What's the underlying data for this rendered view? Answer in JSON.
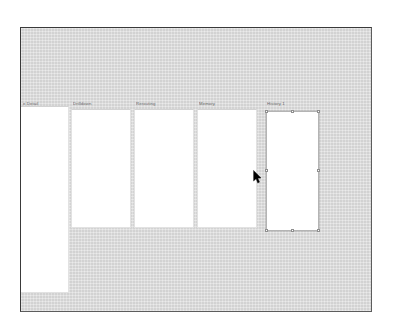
{
  "canvas": {
    "width": 393,
    "height": 333,
    "page_background": "#ffffff"
  },
  "frame": {
    "background": "#d9d9d9",
    "border_color": "#3a3a3a",
    "x": 20,
    "y": 27,
    "width": 352,
    "height": 285
  },
  "columns": [
    {
      "label": "e Detail",
      "label_x": 2,
      "label_y": 73,
      "panel": {
        "x": 0,
        "y": 78,
        "width": 48,
        "height": 187,
        "fill": "#ffffff",
        "flush_left": true,
        "selected": false
      }
    },
    {
      "label": "Drilldown",
      "label_x": 52,
      "label_y": 73,
      "panel": {
        "x": 50,
        "y": 81,
        "width": 60,
        "height": 119,
        "fill": "#ffffff",
        "flush_left": false,
        "selected": false
      }
    },
    {
      "label": "Rerouting",
      "label_x": 115,
      "label_y": 73,
      "panel": {
        "x": 113,
        "y": 81,
        "width": 60,
        "height": 119,
        "fill": "#ffffff",
        "flush_left": false,
        "selected": false
      }
    },
    {
      "label": "Memory",
      "label_x": 178,
      "label_y": 73,
      "panel": {
        "x": 176,
        "y": 81,
        "width": 60,
        "height": 119,
        "fill": "#ffffff",
        "flush_left": false,
        "selected": false
      }
    },
    {
      "label": "History 1",
      "label_x": 246,
      "label_y": 73,
      "panel": {
        "x": 245,
        "y": 83,
        "width": 53,
        "height": 120,
        "fill": "#ffffff",
        "flush_left": false,
        "selected": true
      }
    }
  ],
  "cursor": {
    "icon": "arrow-pointer-cursor",
    "x": 232,
    "y": 142,
    "color": "#000000"
  }
}
